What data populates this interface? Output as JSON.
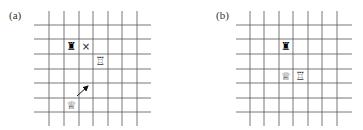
{
  "panels": [
    {
      "id": "a",
      "label": "(a)",
      "label_pos": {
        "x": 9,
        "y": 9
      },
      "grid": {
        "vlines_x": [
          49,
          64,
          79,
          93,
          108,
          122,
          137
        ],
        "hlines_y": [
          25,
          39,
          54,
          69,
          83,
          98,
          112
        ],
        "h_extent": [
          34,
          151
        ],
        "v_extent": [
          11,
          126
        ],
        "line_color": "#555555"
      },
      "pieces": [
        {
          "name": "black-rook",
          "glyph": "♜",
          "x": 71.5,
          "y": 46.5,
          "color": "#000000"
        },
        {
          "name": "capture-mark",
          "glyph": "×",
          "x": 86,
          "y": 46.5,
          "color": "#222222"
        },
        {
          "name": "white-rook",
          "glyph": "♖",
          "x": 100.5,
          "y": 61.5,
          "color": "#333333"
        },
        {
          "name": "white-queen",
          "glyph": "♕",
          "x": 71.5,
          "y": 105,
          "color": "#333333"
        }
      ],
      "arrow": {
        "from": [
          77,
          96
        ],
        "to": [
          88,
          86
        ],
        "color": "#111111"
      }
    },
    {
      "id": "b",
      "label": "(b)",
      "label_pos": {
        "x": 216,
        "y": 9
      },
      "grid": {
        "vlines_x": [
          250,
          264,
          279,
          293,
          308,
          322,
          337
        ],
        "hlines_y": [
          25,
          39,
          54,
          69,
          83,
          98,
          112
        ],
        "h_extent": [
          236,
          352
        ],
        "v_extent": [
          11,
          126
        ],
        "line_color": "#555555"
      },
      "pieces": [
        {
          "name": "black-rook",
          "glyph": "♜",
          "x": 286,
          "y": 46.5,
          "color": "#000000"
        },
        {
          "name": "white-queen",
          "glyph": "♕",
          "x": 286,
          "y": 76,
          "color": "#333333"
        },
        {
          "name": "white-rook",
          "glyph": "♖",
          "x": 300.5,
          "y": 76,
          "color": "#333333"
        }
      ]
    }
  ]
}
